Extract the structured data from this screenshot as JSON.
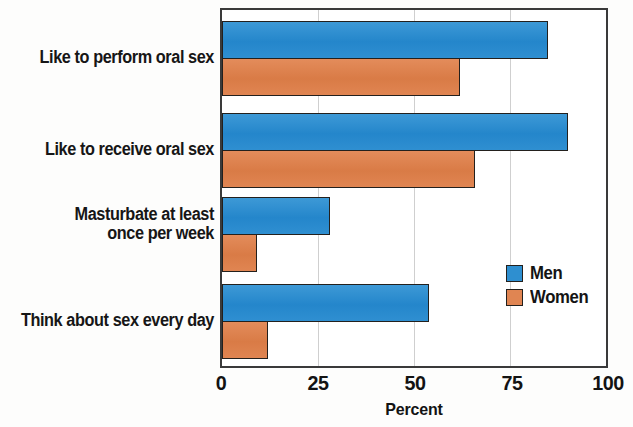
{
  "chart_data": {
    "type": "bar",
    "orientation": "horizontal",
    "title": "",
    "xlabel": "Percent",
    "ylabel": "",
    "xlim": [
      0,
      100
    ],
    "xticks": [
      0,
      25,
      50,
      75,
      100
    ],
    "xtick_labels": [
      "0",
      "25",
      "50",
      "75",
      "100"
    ],
    "grid": "vertical",
    "legend_position": "inside-right",
    "categories": [
      "Like to perform oral sex",
      "Like to receive oral sex",
      "Masturbate at least\nonce per week",
      "Think about sex every day"
    ],
    "series": [
      {
        "name": "Men",
        "color": "#2e8fd0",
        "values": [
          85,
          90,
          28,
          54
        ]
      },
      {
        "name": "Women",
        "color": "#e08552",
        "values": [
          62,
          66,
          9,
          12
        ]
      }
    ]
  },
  "axis": {
    "x_title": "Percent",
    "ticks": [
      "0",
      "25",
      "50",
      "75",
      "100"
    ]
  },
  "legend": {
    "entries": [
      {
        "label": "Men"
      },
      {
        "label": "Women"
      }
    ]
  },
  "colors": {
    "men": "#2e8fd0",
    "women": "#e08552",
    "outline": "#23201d",
    "grid": "#cfcfcf",
    "frame": "#3a3a3a"
  }
}
